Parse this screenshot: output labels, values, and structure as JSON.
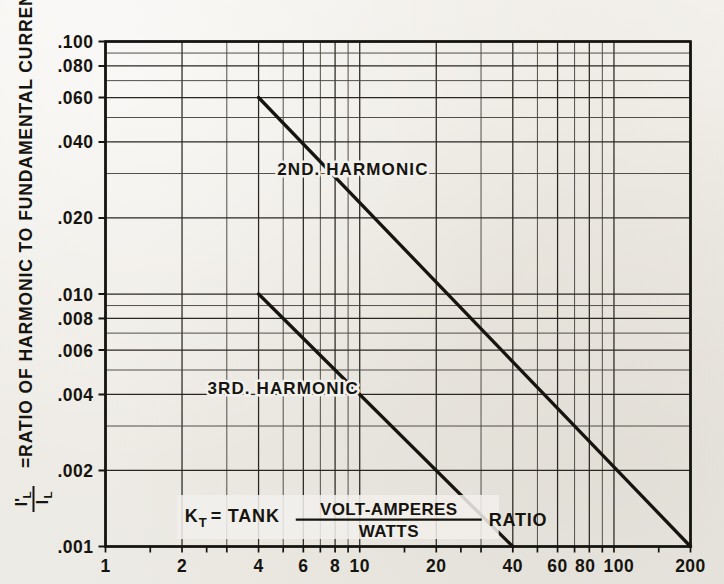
{
  "chart_data": {
    "type": "line",
    "title": "",
    "xlabel": "K_T = TANK VOLT-AMPERES/WATTS RATIO",
    "ylabel": "I'L/IL = RATIO OF HARMONIC TO FUNDAMENTAL CURRENT IN TANK COIL",
    "xscale": "log",
    "yscale": "log",
    "xlim": [
      1,
      200
    ],
    "ylim": [
      0.001,
      0.1
    ],
    "grid": true,
    "legend_position": "inline-annotation",
    "xticks": [
      1,
      2,
      4,
      6,
      8,
      10,
      20,
      40,
      60,
      80,
      100,
      200
    ],
    "xtick_labels": [
      "1",
      "2",
      "4",
      "6",
      "8",
      "10",
      "20",
      "40",
      "60",
      "80",
      "100",
      "200"
    ],
    "yticks": [
      0.001,
      0.002,
      0.004,
      0.006,
      0.008,
      0.01,
      0.02,
      0.04,
      0.06,
      0.08,
      0.1
    ],
    "ytick_labels": [
      ".001",
      ".002",
      ".004",
      ".006",
      ".008",
      ".010",
      ".020",
      ".040",
      ".060",
      ".080",
      ".100"
    ],
    "series": [
      {
        "name": "2ND. HARMONIC",
        "x": [
          4,
          200
        ],
        "y": [
          0.06,
          0.001
        ],
        "annotation": "2ND. HARMONIC",
        "annotation_x": 9.4,
        "annotation_y": 0.0295
      },
      {
        "name": "3RD. HARMONIC",
        "x": [
          4,
          40
        ],
        "y": [
          0.01,
          0.001
        ],
        "annotation": "3RD. HARMONIC",
        "annotation_x": 5.0,
        "annotation_y": 0.004
      }
    ],
    "annotations": [
      {
        "name": "kt-definition",
        "lead": "K",
        "sub": "T",
        "eq": "= TANK",
        "numerator": "VOLT-AMPERES",
        "denominator": "WATTS",
        "trail": "RATIO",
        "x": 2.05,
        "y": 0.00125
      }
    ]
  },
  "ylabel_parts": {
    "numerator": "I'",
    "numerator_sub": "L",
    "denominator": "I",
    "denominator_sub": "L",
    "text": "=RATIO OF HARMONIC TO FUNDAMENTAL CURRENT IN TANK COIL"
  },
  "colors": {
    "ink": "#16140f",
    "grid_major": "#2a2722",
    "grid_minor": "#4a4640",
    "paper": "#f2f0ec"
  }
}
